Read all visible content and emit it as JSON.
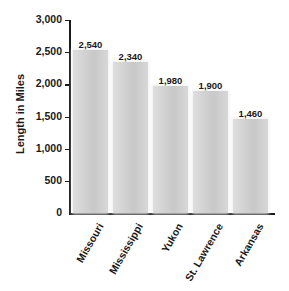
{
  "chart_data": {
    "type": "bar",
    "title": "",
    "xlabel": "",
    "ylabel": "Length in Miles",
    "categories": [
      "Missouri",
      "Mississippi",
      "Yukon",
      "St. Lawrence",
      "Arkansas"
    ],
    "values": [
      2540,
      2340,
      1980,
      1900,
      1460
    ],
    "value_labels": [
      "2,540",
      "2,340",
      "1,980",
      "1,900",
      "1,460"
    ],
    "ylim": [
      0,
      3000
    ],
    "yticks": [
      0,
      500,
      1000,
      1500,
      2000,
      2500,
      3000
    ],
    "ytick_labels": [
      "0",
      "500",
      "1,000",
      "1,500",
      "2,000",
      "2,500",
      "3,000"
    ],
    "grid": false,
    "legend": null,
    "bar_color": "#cccccc"
  }
}
